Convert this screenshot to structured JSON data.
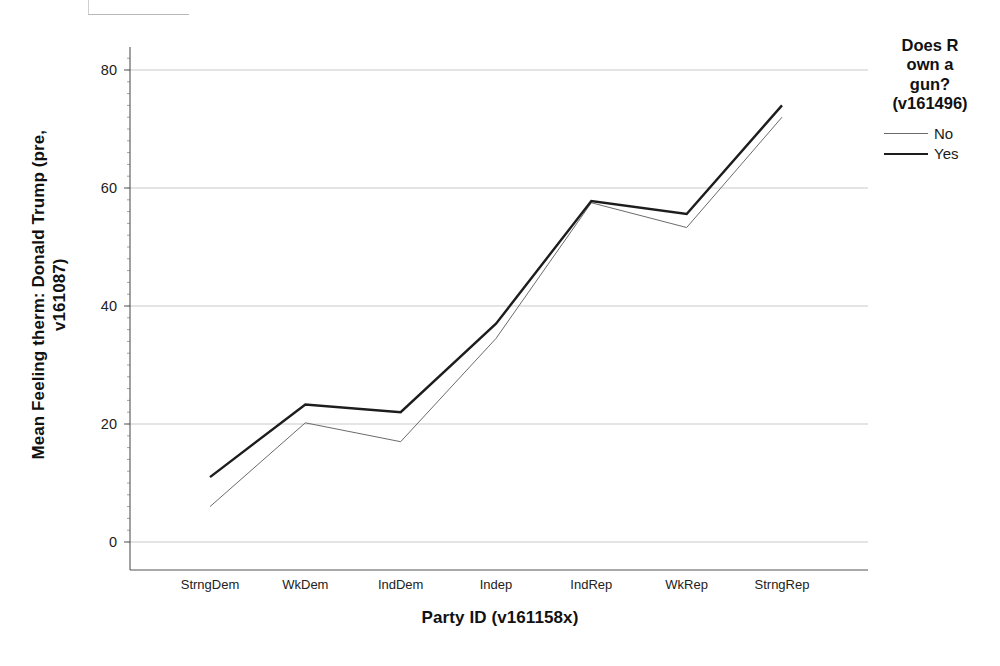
{
  "chart_data": {
    "type": "line",
    "title": "",
    "xlabel": "Party ID (v161158x)",
    "ylabel": "Mean Feeling therm: Donald Trump (pre, v161087)",
    "categories": [
      "StrngDem",
      "WkDem",
      "IndDem",
      "Indep",
      "IndRep",
      "WkRep",
      "StrngRep"
    ],
    "ylim": [
      0,
      80
    ],
    "yticks": [
      0,
      20,
      40,
      60,
      80
    ],
    "grid": true,
    "legend_position": "right",
    "legend_title": "Does R own a gun? (v161496)",
    "series": [
      {
        "name": "No",
        "values": [
          6,
          20.2,
          17,
          34.5,
          57.5,
          53.3,
          72
        ],
        "color": "#6b6b6b",
        "width": 1
      },
      {
        "name": "Yes",
        "values": [
          11,
          23.3,
          22,
          37,
          57.8,
          55.6,
          74
        ],
        "color": "#1d1d1d",
        "width": 2.4
      }
    ]
  },
  "axes": {
    "y_title_line1": "Mean Feeling therm: Donald Trump (pre,",
    "y_title_line2": "v161087)",
    "x_title": "Party ID (v161158x)"
  },
  "legend": {
    "title_lines": [
      "Does R",
      "own a",
      "gun?",
      "(v161496)"
    ],
    "items": [
      {
        "label": "No"
      },
      {
        "label": "Yes"
      }
    ]
  }
}
